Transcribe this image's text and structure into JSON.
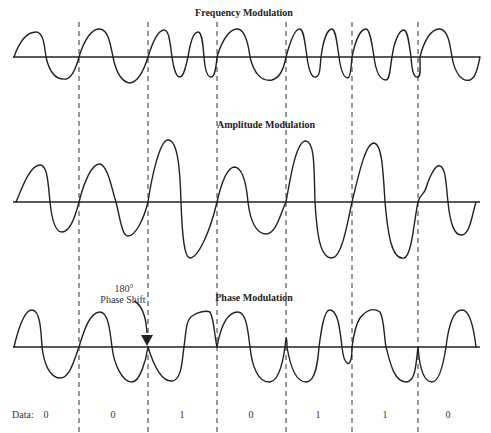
{
  "titles": {
    "fm": "Frequency Modulation",
    "am": "Amplitude Modulation",
    "pm": "Phase Modulation"
  },
  "annotation": {
    "line1": "180°",
    "line2": "Phase Shift"
  },
  "data_row": {
    "label": "Data:",
    "bits": [
      "0",
      "0",
      "1",
      "0",
      "1",
      "1",
      "0"
    ]
  },
  "colors": {
    "line": "#222222",
    "background": "#ffffff"
  }
}
